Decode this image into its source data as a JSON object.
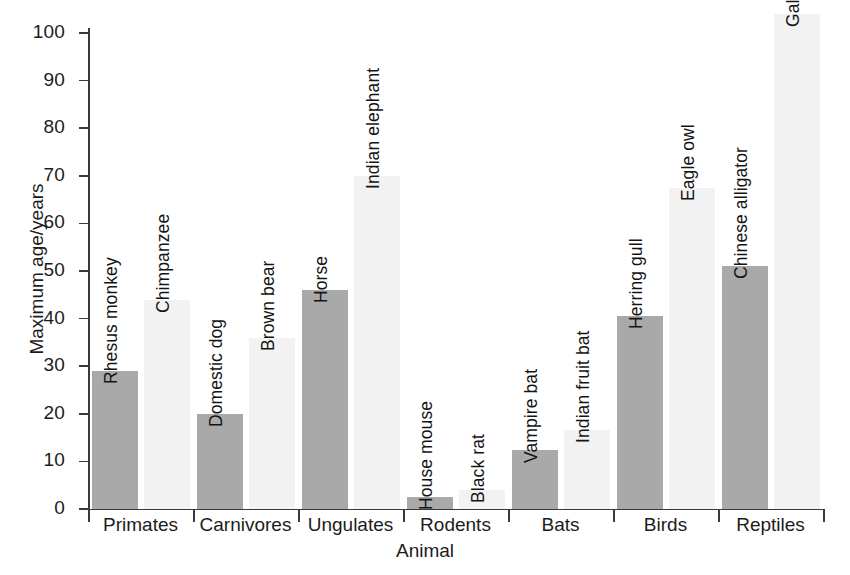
{
  "chart_data": {
    "type": "bar",
    "title": "",
    "xlabel": "Animal",
    "ylabel": "Maximum age/years",
    "ylim": [
      0,
      100
    ],
    "yticks": [
      0,
      10,
      20,
      30,
      40,
      50,
      60,
      70,
      80,
      90,
      100
    ],
    "grid": false,
    "legend": "none",
    "categories": [
      "Primates",
      "Carnivores",
      "Ungulates",
      "Rodents",
      "Bats",
      "Birds",
      "Reptiles"
    ],
    "series": [
      {
        "name": "shorter-lived species",
        "fill": "#a9a9a9",
        "labels": [
          "Rhesus monkey",
          "Domestic dog",
          "Horse",
          "House mouse",
          "Vampire bat",
          "Herring gull",
          "Chinese alligator"
        ],
        "values": [
          29,
          20,
          46,
          2.5,
          12.5,
          40.5,
          51
        ]
      },
      {
        "name": "longer-lived species",
        "fill": "#f2f2f2",
        "labels": [
          "Chimpanzee",
          "Brown bear",
          "Indian elephant",
          "Black rat",
          "Indian fruit bat",
          "Eagle owl",
          "Galapagos tortoise"
        ],
        "values": [
          44,
          36,
          70,
          4,
          16.5,
          67.5,
          104
        ]
      }
    ],
    "bars": [
      {
        "group": "Primates",
        "label": "Rhesus monkey",
        "value": 29,
        "fill": "dark"
      },
      {
        "group": "Primates",
        "label": "Chimpanzee",
        "value": 44,
        "fill": "light"
      },
      {
        "group": "Carnivores",
        "label": "Domestic dog",
        "value": 20,
        "fill": "dark"
      },
      {
        "group": "Carnivores",
        "label": "Brown bear",
        "value": 36,
        "fill": "light"
      },
      {
        "group": "Ungulates",
        "label": "Horse",
        "value": 46,
        "fill": "dark"
      },
      {
        "group": "Ungulates",
        "label": "Indian elephant",
        "value": 70,
        "fill": "light"
      },
      {
        "group": "Rodents",
        "label": "House mouse",
        "value": 2.5,
        "fill": "dark"
      },
      {
        "group": "Rodents",
        "label": "Black rat",
        "value": 4,
        "fill": "light"
      },
      {
        "group": "Bats",
        "label": "Vampire bat",
        "value": 12.5,
        "fill": "dark"
      },
      {
        "group": "Bats",
        "label": "Indian fruit bat",
        "value": 16.5,
        "fill": "light"
      },
      {
        "group": "Birds",
        "label": "Herring gull",
        "value": 40.5,
        "fill": "dark"
      },
      {
        "group": "Birds",
        "label": "Eagle owl",
        "value": 67.5,
        "fill": "light"
      },
      {
        "group": "Reptiles",
        "label": "Chinese alligator",
        "value": 51,
        "fill": "dark"
      },
      {
        "group": "Reptiles",
        "label": "Galapagos tortoise",
        "value": 104,
        "fill": "light"
      }
    ],
    "colors": {
      "dark_bar": "#a9a9a9",
      "light_bar": "#f2f2f2",
      "axis": "#3a3a3a",
      "text": "#1c1c1c",
      "background": "#ffffff"
    }
  }
}
